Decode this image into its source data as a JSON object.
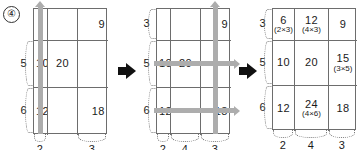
{
  "problem": {
    "marker": "④"
  },
  "separators": {
    "arrow_name": "step-arrow",
    "count": 2
  },
  "panels": [
    {
      "id": "panel-1",
      "rows": [
        {
          "left_label": "",
          "cells": [
            {
              "main": "",
              "sub": ""
            },
            {
              "main": "",
              "sub": ""
            },
            {
              "main": "9",
              "sub": ""
            }
          ]
        },
        {
          "left_label": "5",
          "cells": [
            {
              "main": "10",
              "sub": ""
            },
            {
              "main": "20",
              "sub": ""
            },
            {
              "main": "",
              "sub": ""
            }
          ]
        },
        {
          "left_label": "6",
          "cells": [
            {
              "main": "12",
              "sub": ""
            },
            {
              "main": "",
              "sub": ""
            },
            {
              "main": "18",
              "sub": ""
            }
          ]
        }
      ],
      "bottom_labels": [
        "2",
        "",
        "3"
      ],
      "highlights": [
        {
          "type": "vertical",
          "column": 1,
          "direction": "up"
        }
      ]
    },
    {
      "id": "panel-2",
      "rows": [
        {
          "left_label": "3",
          "cells": [
            {
              "main": "",
              "sub": ""
            },
            {
              "main": "",
              "sub": ""
            },
            {
              "main": "9",
              "sub": ""
            }
          ]
        },
        {
          "left_label": "5",
          "cells": [
            {
              "main": "10",
              "sub": ""
            },
            {
              "main": "20",
              "sub": ""
            },
            {
              "main": "",
              "sub": ""
            }
          ]
        },
        {
          "left_label": "6",
          "cells": [
            {
              "main": "12",
              "sub": ""
            },
            {
              "main": "",
              "sub": ""
            },
            {
              "main": "18",
              "sub": ""
            }
          ]
        }
      ],
      "bottom_labels": [
        "2",
        "4",
        "3"
      ],
      "highlights": [
        {
          "type": "vertical",
          "column": 3,
          "direction": "up"
        },
        {
          "type": "horizontal",
          "row": 2,
          "direction": "right"
        },
        {
          "type": "horizontal",
          "row": 3,
          "direction": "right"
        }
      ]
    },
    {
      "id": "panel-3",
      "rows": [
        {
          "left_label": "3",
          "cells": [
            {
              "main": "6",
              "sub": "(2×3)"
            },
            {
              "main": "12",
              "sub": "(4×3)"
            },
            {
              "main": "9",
              "sub": ""
            }
          ]
        },
        {
          "left_label": "5",
          "cells": [
            {
              "main": "10",
              "sub": ""
            },
            {
              "main": "20",
              "sub": ""
            },
            {
              "main": "15",
              "sub": "(3×5)"
            }
          ]
        },
        {
          "left_label": "6",
          "cells": [
            {
              "main": "12",
              "sub": ""
            },
            {
              "main": "24",
              "sub": "(4×6)"
            },
            {
              "main": "18",
              "sub": ""
            }
          ]
        }
      ],
      "bottom_labels": [
        "2",
        "4",
        "3"
      ],
      "highlights": []
    }
  ],
  "colors": {
    "grid_line": "#6d6d6d",
    "highlight_arrow": "#adadad",
    "step_arrow": "#111111",
    "brace": "#7a7a7a",
    "text": "#1a1a1a"
  }
}
